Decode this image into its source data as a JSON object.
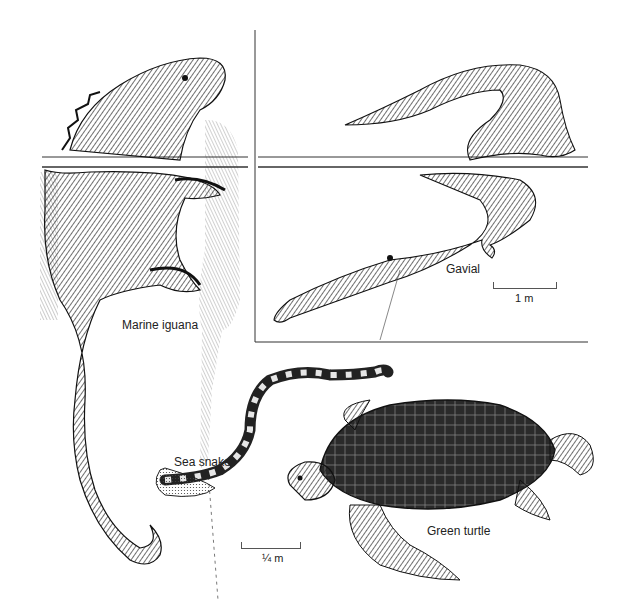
{
  "figure": {
    "background": "#ffffff",
    "ink_color": "#1e1e1e"
  },
  "animals": [
    {
      "name": "marine-iguana",
      "label": "Marine iguana"
    },
    {
      "name": "gavial",
      "label": "Gavial"
    },
    {
      "name": "sea-snake",
      "label": "Sea snake"
    },
    {
      "name": "green-turtle",
      "label": "Green turtle"
    }
  ],
  "scale_bars": [
    {
      "name": "gavial-scale",
      "label": "1 m"
    },
    {
      "name": "small-scale",
      "label": "¼ m"
    }
  ]
}
